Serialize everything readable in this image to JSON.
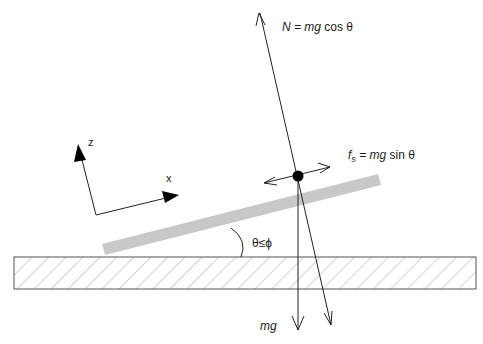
{
  "diagram": {
    "colors": {
      "line": "#222222",
      "incline": "#c8c8c8",
      "ground_border": "#555555",
      "hatch": "#b0b0b0",
      "mass": "#000000"
    },
    "labels": {
      "normal_force": "N = mg cos θ",
      "normal_force_lhs": "N",
      "normal_force_rhs": " = mg cos θ",
      "friction_force_f": "f",
      "friction_force_sub": "s",
      "friction_force_rhs": " = mg sin θ",
      "weight": "mg",
      "angle": "θ≤ϕ",
      "axis_x": "x",
      "axis_z": "z"
    },
    "elements": {
      "ground": "hatched ground block",
      "incline": "inclined plane (grey bar)",
      "mass": "point mass (black dot)",
      "friction_arrow": "double-headed arrow along incline",
      "normal_arrow": "normal force arrow (up, perpendicular to incline)",
      "weight_arrow": "gravity arrow (vertical down)",
      "normal_extension": "line perpendicular to incline, extended down with arrowhead",
      "angle_arc": "arc marking incline angle",
      "axes": "tilted x-z coordinate axes"
    }
  }
}
